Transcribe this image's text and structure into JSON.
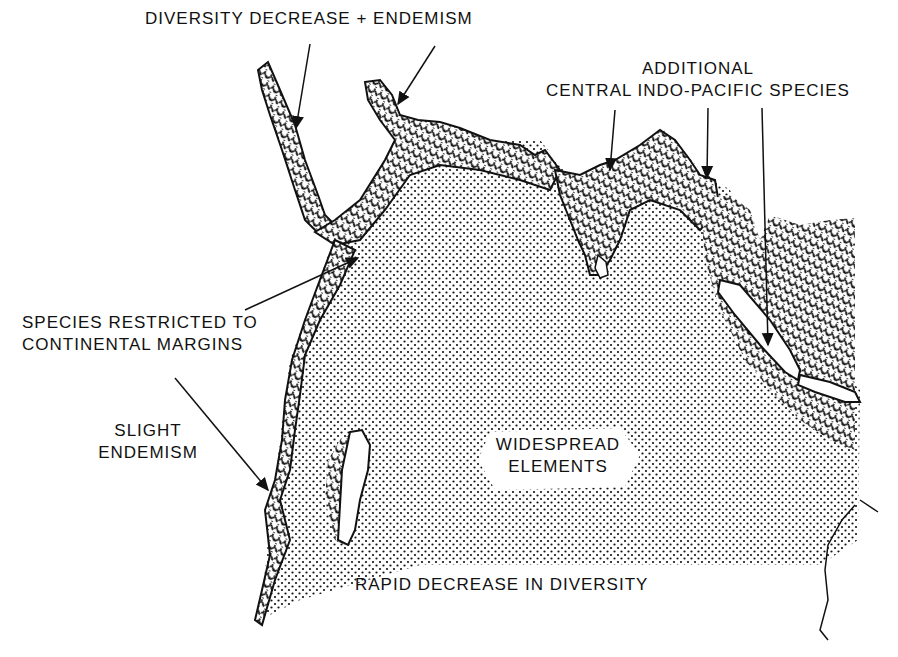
{
  "map": {
    "title": "Indian Ocean species diversity patterns",
    "colors": {
      "ink": "#111111",
      "background": "#ffffff"
    },
    "legend_patterns": {
      "stipple": "widespread-elements-zone",
      "wavy_hatch": "continental-margin-zone"
    }
  },
  "labels": {
    "diversity_decrease": "DIVERSITY DECREASE + ENDEMISM",
    "additional_line1": "ADDITIONAL",
    "additional_line2": "CENTRAL INDO-PACIFIC SPECIES",
    "restricted_line1": "SPECIES RESTRICTED TO",
    "restricted_line2": "CONTINENTAL MARGINS",
    "slight_line1": "SLIGHT",
    "slight_line2": "ENDEMISM",
    "widespread_line1": "WIDESPREAD",
    "widespread_line2": "ELEMENTS",
    "rapid_decrease": "RAPID DECREASE IN DIVERSITY"
  }
}
